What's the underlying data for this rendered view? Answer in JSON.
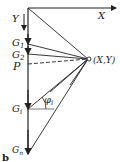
{
  "diagram": {
    "axes": {
      "x_label": "X",
      "y_label": "Y"
    },
    "nodes": {
      "g1": "G",
      "g1_sub": "1",
      "g2": "G",
      "g2_sub": "2",
      "p": "P",
      "gi": "G",
      "gi_sub": "i",
      "gn": "G",
      "gn_sub": "n",
      "point": "(X,Y)"
    },
    "angle_label": "φ",
    "angle_sub": "i",
    "panel_label": "b",
    "colors": {
      "line": "#222222",
      "background": "#ffffff"
    }
  }
}
